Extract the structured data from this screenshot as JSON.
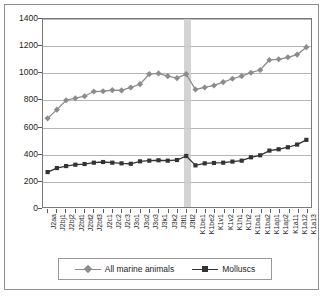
{
  "chart_data": {
    "type": "line",
    "title": "",
    "xlabel": "",
    "ylabel": "",
    "ylim": [
      0,
      1400
    ],
    "ytick_step": 200,
    "yticks": [
      0,
      200,
      400,
      600,
      800,
      1000,
      1200,
      1400
    ],
    "grid": true,
    "legend_position": "bottom",
    "categories": [
      "J2aa",
      "J2bj1",
      "J2bj2",
      "J2bt1",
      "J2bt2",
      "J2bt3",
      "J2c1",
      "J2c2",
      "J2c3",
      "J3o1",
      "J3o2",
      "J3o3",
      "J3k1",
      "J3k2",
      "J3tl1",
      "J3tl2",
      "K1be1",
      "K1be2",
      "K1v1",
      "K1v2",
      "K1h1",
      "K1h2",
      "K1ba1",
      "K1ba2",
      "K1ap1",
      "K1ap2",
      "K1a11",
      "K1a12",
      "K1a13"
    ],
    "series": [
      {
        "name": "All marine animals",
        "color": "#8c8c8c",
        "marker": "diamond",
        "values": [
          660,
          725,
          795,
          810,
          825,
          860,
          862,
          870,
          868,
          890,
          915,
          990,
          995,
          975,
          960,
          990,
          875,
          890,
          905,
          930,
          955,
          975,
          1000,
          1020,
          1095,
          1100,
          1115,
          1135,
          1190
        ]
      },
      {
        "name": "Molluscs",
        "color": "#333333",
        "marker": "square",
        "values": [
          260,
          290,
          305,
          315,
          320,
          330,
          335,
          330,
          325,
          322,
          340,
          345,
          348,
          345,
          350,
          380,
          310,
          325,
          328,
          330,
          338,
          345,
          370,
          385,
          420,
          430,
          445,
          465,
          500
        ]
      }
    ],
    "highlight_band": {
      "category": "J3tl2",
      "color": "#cccccc"
    }
  },
  "legend": {
    "entries": [
      {
        "label": "All marine animals"
      },
      {
        "label": "Molluscs"
      }
    ]
  }
}
